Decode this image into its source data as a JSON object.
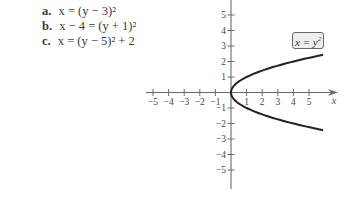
{
  "problems": [
    {
      "label": "a.",
      "equation": "x = (y − 3)²"
    },
    {
      "label": "b.",
      "equation": "x − 4 = (y + 1)²"
    },
    {
      "label": "c.",
      "equation": "x = (y − 5)² + 2"
    }
  ],
  "chart_data": {
    "type": "line",
    "title": "",
    "xlabel": "x",
    "ylabel": "",
    "xlim": [
      -5,
      6
    ],
    "ylim": [
      -6,
      6
    ],
    "grid": false,
    "x_ticks": [
      -5,
      -4,
      -3,
      -2,
      -1,
      1,
      2,
      3,
      4,
      5
    ],
    "y_ticks": [
      5,
      4,
      3,
      2,
      1,
      -1,
      -2,
      -3,
      -4,
      -5
    ],
    "series": [
      {
        "name": "x = y²",
        "equation": "x = y^2",
        "points": [
          {
            "x": 5.9,
            "y": 2.43
          },
          {
            "x": 4,
            "y": 2
          },
          {
            "x": 2.25,
            "y": 1.5
          },
          {
            "x": 1,
            "y": 1
          },
          {
            "x": 0.25,
            "y": 0.5
          },
          {
            "x": 0,
            "y": 0
          },
          {
            "x": 0.25,
            "y": -0.5
          },
          {
            "x": 1,
            "y": -1
          },
          {
            "x": 2.25,
            "y": -1.5
          },
          {
            "x": 4,
            "y": -2
          },
          {
            "x": 5.9,
            "y": -2.43
          }
        ]
      }
    ],
    "annotations": [
      {
        "text": "x = y",
        "superscript": "2",
        "boxed": true,
        "position": "upper-right"
      }
    ]
  }
}
